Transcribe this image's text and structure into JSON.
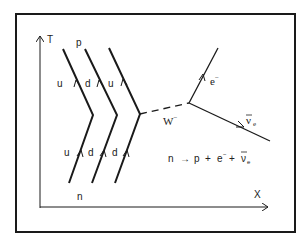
{
  "diagram": {
    "type": "feynman-diagram",
    "axes": {
      "vertical_label": "T",
      "horizontal_label": "X"
    },
    "initial_particle": "n",
    "final_particle": "p",
    "initial_quarks": [
      "u",
      "d",
      "d"
    ],
    "final_quarks": [
      "u",
      "d",
      "u"
    ],
    "boson": {
      "label": "W",
      "charge": "−"
    },
    "electron": {
      "label": "e",
      "charge": "−"
    },
    "antineutrino": {
      "label": "ν",
      "subscript": "e",
      "bar": true
    },
    "equation": {
      "lhs": "n",
      "arrow": "→",
      "p": "p",
      "plus1": "+",
      "e": "e",
      "e_sup": "−",
      "plus2": "+",
      "nu": "ν",
      "nu_sub": "e"
    },
    "colors": {
      "line": "#1a1a1a",
      "frame": "#1a1a1a",
      "background": "#ffffff"
    }
  }
}
